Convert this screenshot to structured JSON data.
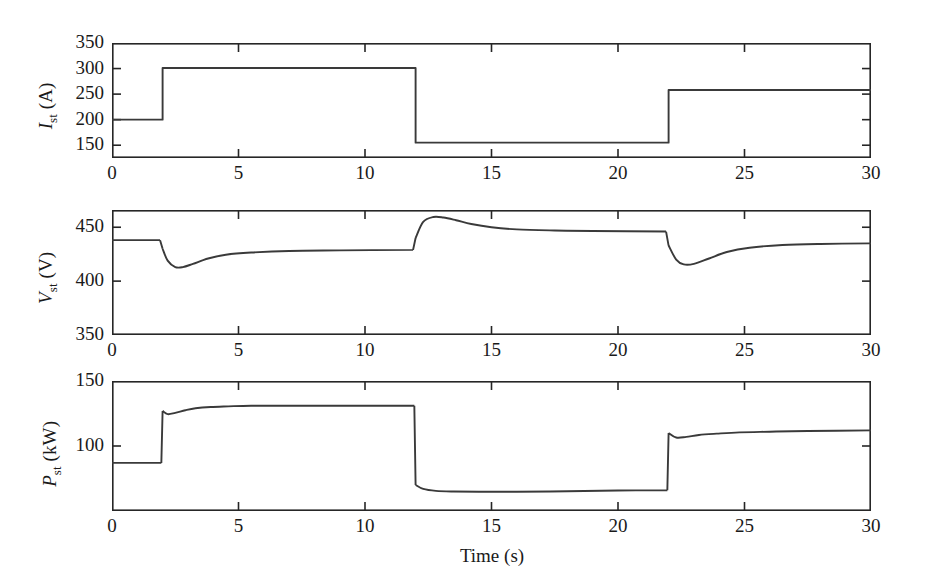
{
  "figure": {
    "xlabel": "Time (s)",
    "background": "#ffffff",
    "line_color": "#3a3a3a",
    "axis_color": "#262626"
  },
  "panels": [
    {
      "id": "current",
      "ylabel_var": "I",
      "ylabel_sub": "st",
      "ylabel_unit": " (A)",
      "ylabel_full": "I_st (A)",
      "yticks": [
        150,
        200,
        250,
        300,
        350
      ],
      "ytick_labels": [
        "150",
        "200",
        "250",
        "300",
        "350"
      ],
      "ylim": [
        125,
        350
      ],
      "xticks": [
        0,
        5,
        10,
        15,
        20,
        25,
        30
      ],
      "xtick_labels": [
        "0",
        "5",
        "10",
        "15",
        "20",
        "25",
        "30"
      ],
      "xlim": [
        0,
        30
      ],
      "show_xtick_labels": true
    },
    {
      "id": "voltage",
      "ylabel_var": "V",
      "ylabel_sub": "st",
      "ylabel_unit": " (V)",
      "ylabel_full": "V_st (V)",
      "yticks": [
        350,
        400,
        450
      ],
      "ytick_labels": [
        "350",
        "400",
        "450"
      ],
      "ylim": [
        350,
        466
      ],
      "xticks": [
        0,
        5,
        10,
        15,
        20,
        25,
        30
      ],
      "xtick_labels": [
        "0",
        "5",
        "10",
        "15",
        "20",
        "25",
        "30"
      ],
      "xlim": [
        0,
        30
      ],
      "show_xtick_labels": true
    },
    {
      "id": "power",
      "ylabel_var": "P",
      "ylabel_sub": "st",
      "ylabel_unit": " (kW)",
      "ylabel_full": "P_st (kW)",
      "yticks": [
        100,
        150
      ],
      "ytick_labels": [
        "100",
        "150"
      ],
      "ylim": [
        50,
        150
      ],
      "xticks": [
        0,
        5,
        10,
        15,
        20,
        25,
        30
      ],
      "xtick_labels": [
        "0",
        "5",
        "10",
        "15",
        "20",
        "25",
        "30"
      ],
      "xlim": [
        0,
        30
      ],
      "show_xtick_labels": true
    }
  ],
  "chart_data": [
    {
      "type": "line",
      "title": "",
      "xlabel": "Time (s)",
      "ylabel": "I_st (A)",
      "xlim": [
        0,
        30
      ],
      "ylim": [
        125,
        350
      ],
      "grid": false,
      "legend": "none",
      "series": [
        {
          "name": "Stack current",
          "x": [
            0,
            2,
            2,
            12,
            12,
            22,
            22,
            30
          ],
          "values": [
            200,
            200,
            301,
            301,
            155,
            155,
            258,
            258
          ]
        }
      ]
    },
    {
      "type": "line",
      "title": "",
      "xlabel": "Time (s)",
      "ylabel": "V_st (V)",
      "xlim": [
        0,
        30
      ],
      "ylim": [
        350,
        466
      ],
      "grid": false,
      "legend": "none",
      "series": [
        {
          "name": "Stack voltage",
          "x": [
            0,
            1.9,
            2.0,
            2.2,
            2.5,
            2.8,
            3.2,
            3.8,
            4.5,
            5.5,
            7.0,
            9.0,
            11.9,
            12.0,
            12.3,
            12.7,
            13.1,
            13.6,
            14.2,
            15.0,
            16.0,
            17.5,
            19.0,
            21.9,
            22.0,
            22.3,
            22.6,
            23.0,
            23.6,
            24.3,
            25.2,
            26.5,
            28.0,
            30.0
          ],
          "values": [
            438,
            438,
            430,
            419,
            413,
            413,
            416,
            421,
            424.5,
            426.5,
            428,
            428.5,
            429,
            440,
            455,
            459.5,
            459,
            456.5,
            453,
            450,
            448,
            447,
            446.5,
            446,
            433,
            420,
            415.5,
            416,
            421,
            427,
            431,
            433.5,
            434.5,
            435
          ]
        }
      ]
    },
    {
      "type": "line",
      "title": "",
      "xlabel": "Time (s)",
      "ylabel": "P_st (kW)",
      "xlim": [
        0,
        30
      ],
      "ylim": [
        50,
        150
      ],
      "grid": false,
      "legend": "none",
      "series": [
        {
          "name": "Stack power",
          "x": [
            0,
            1.95,
            2.0,
            2.2,
            2.5,
            2.9,
            3.3,
            3.9,
            4.6,
            5.5,
            7.0,
            9.0,
            11.95,
            12.0,
            12.3,
            12.8,
            13.5,
            14.5,
            16.0,
            18.0,
            20.0,
            21.95,
            22.0,
            22.3,
            22.7,
            23.2,
            23.9,
            24.8,
            26.0,
            27.5,
            30.0
          ],
          "values": [
            87,
            87,
            127,
            124.5,
            125.5,
            127.5,
            129,
            130,
            130.5,
            131,
            131,
            131,
            131,
            70,
            67,
            65.5,
            65,
            64.8,
            64.8,
            65.2,
            65.8,
            66,
            110,
            106.5,
            107,
            108.5,
            109.5,
            110.5,
            111,
            111.5,
            112
          ]
        }
      ]
    }
  ]
}
